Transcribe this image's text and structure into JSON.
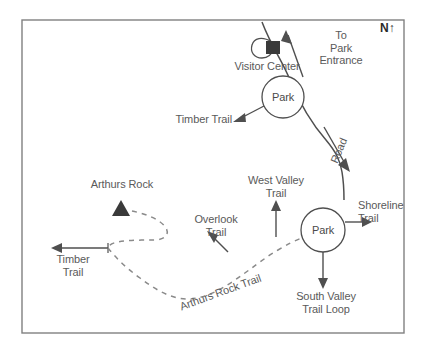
{
  "map": {
    "title": "Park Trail Map",
    "compass": "N↑",
    "colors": {
      "border": "#777777",
      "line": "#4f4f4f",
      "dashed_trail": "#8a8a8a",
      "text": "#5a5a5a",
      "marker_fill": "#3a3a3a",
      "background": "#ffffff"
    },
    "labels": {
      "visitor_center": "Visitor Center",
      "to_park_entrance": "To\nPark\nEntrance",
      "park_north": "Park",
      "park_south": "Park",
      "timber_trail_north": "Timber Trail",
      "timber_trail_west": "Timber\nTrail",
      "road": "Road",
      "arthurs_rock": "Arthurs Rock",
      "overlook_trail": "Overlook\nTrail",
      "arthurs_rock_trail": "Arthurs Rock Trail",
      "west_valley_trail": "West Valley\nTrail",
      "shoreline_trail": "Shoreline\nTrail",
      "south_valley_trail_loop": "South Valley\nTrail Loop"
    },
    "markers": {
      "visitor_center_building": "building-square-marker",
      "arthurs_rock_peak": "peak-triangle-marker"
    }
  }
}
